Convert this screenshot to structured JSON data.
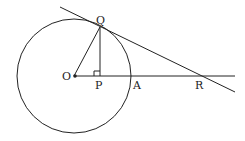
{
  "diagram": {
    "points": {
      "O": "O",
      "Q": "Q",
      "P": "P",
      "A": "A",
      "R": "R"
    },
    "colors": {
      "stroke": "#222222",
      "background": "#ffffff"
    }
  }
}
